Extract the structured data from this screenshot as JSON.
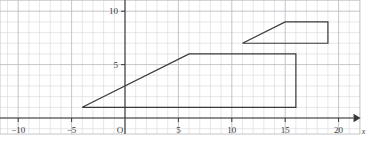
{
  "figure": {
    "kind": "coordinate-grid-plot",
    "background_color": "#ffffff",
    "grid": {
      "minor_color": "#d8d8dc",
      "major_color": "#b8b8be",
      "minor_step_units": 1,
      "major_step_units": 5,
      "visible": true,
      "x_range": [
        -13,
        22
      ],
      "y_range": [
        -1.5,
        12.2
      ]
    },
    "axes": {
      "color": "#3a3a3a",
      "origin_label": "O",
      "x_axis_letter": "x",
      "y_axis_letter": "y",
      "x_ticks": [
        {
          "value": -10,
          "label": "−10"
        },
        {
          "value": -5,
          "label": "−5"
        },
        {
          "value": 5,
          "label": "5"
        },
        {
          "value": 10,
          "label": "10"
        },
        {
          "value": 15,
          "label": "15"
        },
        {
          "value": 20,
          "label": "20"
        }
      ],
      "y_ticks": [
        {
          "value": 5,
          "label": "5"
        },
        {
          "value": 10,
          "label": "10"
        }
      ],
      "has_x_arrow": true,
      "has_y_arrow": true
    },
    "shapes": [
      {
        "name": "lower-trapezoid",
        "stroke_color": "#3a3a3a",
        "stroke_width": 1.2,
        "fill": "none",
        "closed": true,
        "vertices": [
          {
            "x": -4,
            "y": 1
          },
          {
            "x": 6,
            "y": 6
          },
          {
            "x": 16,
            "y": 6
          },
          {
            "x": 16,
            "y": 1
          }
        ]
      },
      {
        "name": "upper-trapezoid",
        "stroke_color": "#3a3a3a",
        "stroke_width": 1.2,
        "fill": "none",
        "closed": true,
        "vertices": [
          {
            "x": 11,
            "y": 7
          },
          {
            "x": 15,
            "y": 9
          },
          {
            "x": 19,
            "y": 9
          },
          {
            "x": 19,
            "y": 7
          }
        ]
      }
    ]
  },
  "chart_data": {
    "type": "scatter",
    "title": "",
    "xlabel": "x",
    "ylabel": "y",
    "xlim": [
      -13,
      22
    ],
    "ylim": [
      -1.5,
      12.2
    ],
    "grid": true,
    "legend": "none",
    "x_tick_labels": [
      "−10",
      "−5",
      "5",
      "10",
      "15",
      "20"
    ],
    "x_tick_values": [
      -10,
      -5,
      5,
      10,
      15,
      20
    ],
    "y_tick_labels": [
      "5",
      "10"
    ],
    "y_tick_values": [
      5,
      10
    ],
    "origin_label": "O",
    "series": [
      {
        "name": "lower-trapezoid",
        "closed": true,
        "x": [
          -4,
          6,
          16,
          16
        ],
        "y": [
          1,
          6,
          6,
          1
        ]
      },
      {
        "name": "upper-trapezoid",
        "closed": true,
        "x": [
          11,
          15,
          19,
          19
        ],
        "y": [
          7,
          9,
          9,
          7
        ]
      }
    ],
    "annotations": []
  }
}
